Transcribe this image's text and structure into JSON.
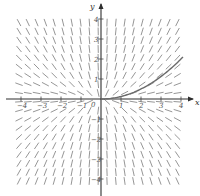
{
  "diagram": {
    "type": "slope-field",
    "equation_form": "dy/dx = 2y/x",
    "x_axis": {
      "label": "x",
      "ticks": [
        -4,
        -3,
        -2,
        -1,
        1,
        2,
        3,
        4
      ],
      "range": [
        -4,
        4
      ]
    },
    "y_axis": {
      "label": "y",
      "ticks": [
        4,
        3,
        2,
        1,
        -1,
        -2,
        -3,
        -4
      ],
      "range": [
        -4,
        4
      ]
    },
    "origin_label": "0",
    "solution_curve": {
      "description": "y = x^2/8",
      "x_range": [
        0,
        4.1
      ]
    },
    "grid_step": 0.44,
    "grid_extent": 4.1,
    "segment_length_px": 7,
    "colors": {
      "segments": "#8a8a8a",
      "axes": "#2e2e2e",
      "curve": "#6a6a6a"
    }
  }
}
